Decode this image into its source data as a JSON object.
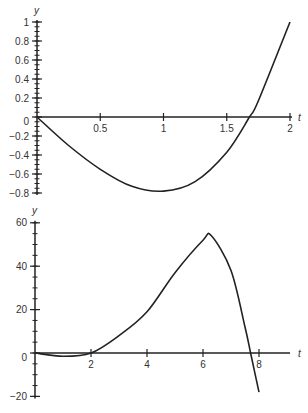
{
  "chart_data": [
    {
      "type": "line",
      "title": "",
      "xlabel": "t",
      "ylabel": "y",
      "xlim": [
        0,
        2
      ],
      "ylim": [
        -0.8,
        1
      ],
      "grid": false,
      "x_ticks": [
        "0.5",
        "1",
        "1.5",
        "2"
      ],
      "y_ticks": [
        "1",
        "0.8",
        "0.6",
        "0.4",
        "0.2",
        "0",
        "-0.2",
        "-0.4",
        "-0.6",
        "-0.8"
      ],
      "series": [
        {
          "name": "curve",
          "x": [
            0,
            0.25,
            0.5,
            0.75,
            1.0,
            1.25,
            1.5,
            1.68,
            1.75,
            2.0
          ],
          "values": [
            0,
            -0.3,
            -0.55,
            -0.73,
            -0.78,
            -0.68,
            -0.37,
            0,
            0.17,
            1.0
          ]
        }
      ]
    },
    {
      "type": "line",
      "title": "",
      "xlabel": "t",
      "ylabel": "y",
      "xlim": [
        0,
        8
      ],
      "ylim": [
        -20,
        60
      ],
      "grid": false,
      "x_ticks": [
        "2",
        "4",
        "6",
        "8"
      ],
      "y_ticks": [
        "60",
        "40",
        "20",
        "0",
        "-20"
      ],
      "series": [
        {
          "name": "curve",
          "x": [
            0,
            1,
            2,
            3,
            4,
            5,
            6,
            6.3,
            7,
            7.5,
            7.7,
            8
          ],
          "values": [
            0,
            -1.5,
            0,
            8,
            19,
            37,
            52,
            54,
            38,
            12,
            0,
            -18
          ]
        }
      ]
    }
  ],
  "chart1": {
    "ylabel": "y",
    "xlabel": "t",
    "yticks": [
      {
        "label": "1",
        "v": 1
      },
      {
        "label": "0.8",
        "v": 0.8
      },
      {
        "label": "0.6",
        "v": 0.6
      },
      {
        "label": "0.4",
        "v": 0.4
      },
      {
        "label": "0.2",
        "v": 0.2
      },
      {
        "label": "0",
        "v": 0
      },
      {
        "label": "−0.2",
        "v": -0.2
      },
      {
        "label": "−0.4",
        "v": -0.4
      },
      {
        "label": "−0.6",
        "v": -0.6
      },
      {
        "label": "−0.8",
        "v": -0.8
      }
    ],
    "xticks": [
      {
        "label": "0.5",
        "v": 0.5
      },
      {
        "label": "1",
        "v": 1
      },
      {
        "label": "1.5",
        "v": 1.5
      },
      {
        "label": "2",
        "v": 2
      }
    ]
  },
  "chart2": {
    "ylabel": "y",
    "xlabel": "t",
    "yticks": [
      {
        "label": "60",
        "v": 60
      },
      {
        "label": "40",
        "v": 40
      },
      {
        "label": "20",
        "v": 20
      },
      {
        "label": "0",
        "v": 0
      },
      {
        "label": "−20",
        "v": -20
      }
    ],
    "xticks": [
      {
        "label": "2",
        "v": 2
      },
      {
        "label": "4",
        "v": 4
      },
      {
        "label": "6",
        "v": 6
      },
      {
        "label": "8",
        "v": 8
      }
    ]
  }
}
